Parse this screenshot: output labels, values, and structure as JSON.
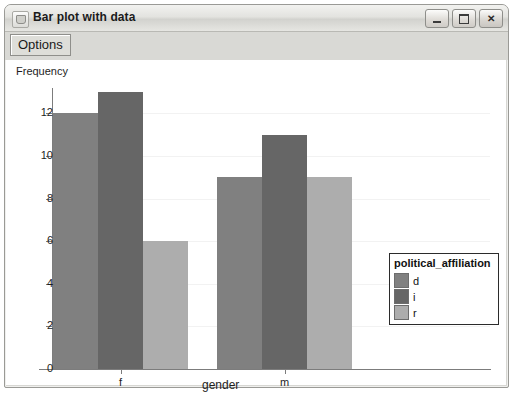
{
  "window": {
    "title": "Bar plot with data",
    "icon": "app-icon",
    "buttons": {
      "minimize": "minimize-icon",
      "maximize": "maximize-icon",
      "close": "✕"
    }
  },
  "toolbar": {
    "options_label": "Options"
  },
  "chart_data": {
    "type": "bar",
    "title": "",
    "xlabel": "gender",
    "ylabel": "Frequency",
    "categories": [
      "f",
      "m"
    ],
    "series": [
      {
        "name": "d",
        "values": [
          12,
          9
        ],
        "color": "#808080"
      },
      {
        "name": "i",
        "values": [
          13,
          11
        ],
        "color": "#666666"
      },
      {
        "name": "r",
        "values": [
          6,
          9
        ],
        "color": "#adadad"
      }
    ],
    "legend_title": "political_affiliation",
    "legend_position": "right",
    "ylim": [
      0,
      13.8
    ],
    "yticks": [
      0,
      2,
      4,
      6,
      8,
      10,
      12
    ],
    "ytick_labels": [
      "0",
      "2",
      "4",
      "6",
      "8",
      "10",
      "12"
    ],
    "grid": true,
    "bar_edge_color": "#ffffff",
    "plot_background": "#ffffff"
  }
}
